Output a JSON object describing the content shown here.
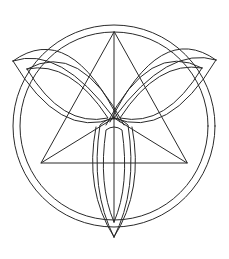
{
  "figure": {
    "stroke_color": "#2a2a2a",
    "background_color": "#ffffff",
    "elements": [
      "outer-circle-ring",
      "inscribed-triangle",
      "triangle-medians",
      "triquetra-left-leaf",
      "triquetra-right-leaf",
      "triquetra-bottom-leaf"
    ]
  }
}
